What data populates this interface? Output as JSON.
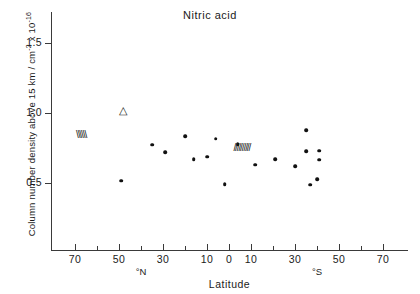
{
  "chart_data": {
    "type": "scatter",
    "title": "Nitric acid",
    "xlabel": "Latitude",
    "ylabel": "Column number density above 15 km / cm",
    "ylabel_exp1": "-2",
    "ylabel_mid": " x 10",
    "ylabel_exp2": "-16",
    "ylabel_full": "Column number density above 15 km / cm-2 x 10-16",
    "xlim": [
      -80,
      80
    ],
    "ylim": [
      0.22,
      1.72
    ],
    "grid": false,
    "legend": "none",
    "y_ticks": [
      {
        "value": 1.5,
        "label": "1.5"
      },
      {
        "value": 1.0,
        "label": "1.0"
      },
      {
        "value": 0.5,
        "label": "0.5"
      }
    ],
    "x_ticks": [
      {
        "value": -70,
        "label": "70"
      },
      {
        "value": -50,
        "label": "50"
      },
      {
        "value": -30,
        "label": "30"
      },
      {
        "value": -10,
        "label": "10"
      },
      {
        "value": 0,
        "label": "0"
      },
      {
        "value": 10,
        "label": "10"
      },
      {
        "value": 30,
        "label": "30"
      },
      {
        "value": 50,
        "label": "50"
      },
      {
        "value": 70,
        "label": "70"
      }
    ],
    "x_minor_ticks": [
      -60,
      -40,
      -20,
      20,
      40,
      60
    ],
    "hemisphere_labels": [
      {
        "value": -40,
        "label": "°N"
      },
      {
        "value": 40,
        "label": "°S"
      }
    ],
    "series": [
      {
        "name": "Nitric acid column measurements",
        "marker": "filled-circle",
        "points": [
          {
            "x": -49,
            "y": 0.515
          },
          {
            "x": -35,
            "y": 0.775
          },
          {
            "x": -29,
            "y": 0.718
          },
          {
            "x": -20,
            "y": 0.835
          },
          {
            "x": -16,
            "y": 0.672
          },
          {
            "x": -10,
            "y": 0.688
          },
          {
            "x": -6,
            "y": 0.815
          },
          {
            "x": -2,
            "y": 0.492
          },
          {
            "x": 4,
            "y": 0.778
          },
          {
            "x": 12,
            "y": 0.632
          },
          {
            "x": 21,
            "y": 0.67
          },
          {
            "x": 30,
            "y": 0.622
          },
          {
            "x": 35,
            "y": 0.878
          },
          {
            "x": 35,
            "y": 0.728
          },
          {
            "x": 41,
            "y": 0.73
          },
          {
            "x": 41,
            "y": 0.665
          },
          {
            "x": 40,
            "y": 0.528
          },
          {
            "x": 37,
            "y": 0.487
          }
        ]
      },
      {
        "name": "Open triangle measurement",
        "marker": "open-triangle",
        "points": [
          {
            "x": -48,
            "y": 1.018
          }
        ]
      }
    ],
    "annotations": [
      {
        "name": "left-hatch-band",
        "symbol": "\\\\\\\\\\\\",
        "x": -70,
        "y": 0.845,
        "style": "backslash-hatch"
      },
      {
        "name": "center-hatch-band",
        "symbol": "//////////",
        "x": 2,
        "y": 0.752,
        "style": "forwardslash-hatch"
      }
    ]
  }
}
